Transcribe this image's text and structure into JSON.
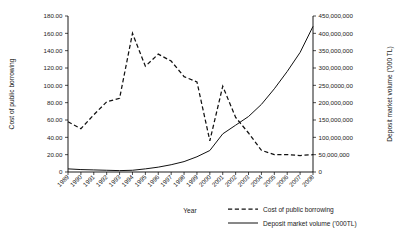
{
  "chart_data": {
    "type": "line",
    "title": "",
    "xlabel": "Year",
    "ylabel": "Cost of public borrowing",
    "y2label": "Deposit market volume ('000 TL)",
    "grid": false,
    "legend_position": "bottom-right",
    "categories": [
      "1989",
      "1990",
      "1991",
      "1992",
      "1993",
      "1994",
      "1995",
      "1996",
      "1997",
      "1998",
      "1999",
      "2000",
      "2001",
      "2002",
      "2003",
      "2004",
      "2005",
      "2006",
      "2007",
      "2008"
    ],
    "ylim": [
      0,
      180
    ],
    "yticks": [
      "0",
      "20.00",
      "40.00",
      "60.00",
      "80.00",
      "100.00",
      "120.00",
      "140.00",
      "160.00",
      "180.00"
    ],
    "ytick_values": [
      0,
      20,
      40,
      60,
      80,
      100,
      120,
      140,
      160,
      180
    ],
    "y2lim": [
      0,
      450000000
    ],
    "y2ticks": [
      "0",
      "50,000,000",
      "100,000,000",
      "150,000,000",
      "200,000,000",
      "250,0000,00",
      "300,000,000",
      "350,000,000",
      "400,000,000",
      "450,000,000"
    ],
    "y2tick_values": [
      0,
      50000000,
      100000000,
      150000000,
      200000000,
      250000000,
      300000000,
      350000000,
      400000000,
      450000000
    ],
    "series": [
      {
        "name": "Cost of public borrowing",
        "axis": "left",
        "style": "dashed",
        "values": [
          58,
          50,
          66,
          81,
          85,
          160,
          122,
          136,
          128,
          110,
          104,
          36,
          99,
          63,
          45,
          25,
          20,
          20,
          19,
          20
        ]
      },
      {
        "name": "Deposit market volume ('000TL)",
        "axis": "right",
        "style": "solid",
        "values": [
          9000000,
          7000000,
          6000000,
          5000000,
          4000000,
          5000000,
          9000000,
          14000000,
          21000000,
          30000000,
          44000000,
          62000000,
          110000000,
          135000000,
          160000000,
          195000000,
          240000000,
          290000000,
          345000000,
          420000000
        ]
      }
    ]
  },
  "legend": {
    "entries": [
      {
        "label": "Cost of public borrowing",
        "style": "dashed"
      },
      {
        "label": "Deposit market volume ('000TL)",
        "style": "solid"
      }
    ]
  }
}
